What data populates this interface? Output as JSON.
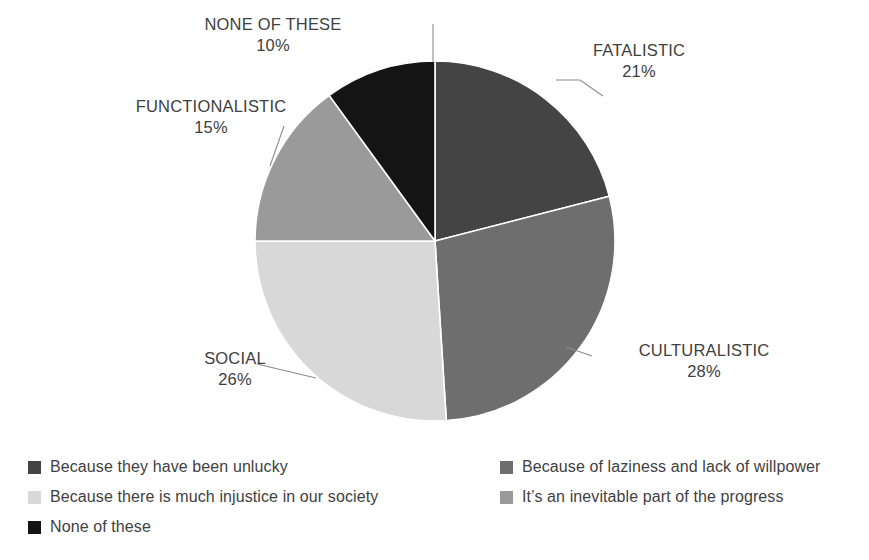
{
  "chart_data": {
    "type": "pie",
    "title": "",
    "categories": [
      "FATALISTIC",
      "CULTURALISTIC",
      "SOCIAL",
      "FUNCTIONALISTIC",
      "NONE OF THESE"
    ],
    "values": [
      21,
      28,
      26,
      15,
      10
    ],
    "unit": "%",
    "start_angle_deg": 0,
    "direction": "clockwise",
    "colors": [
      "#444444",
      "#6e6e6e",
      "#d8d8d8",
      "#9a9a9a",
      "#141414"
    ],
    "slice_separator_color": "#ffffff",
    "grid": false,
    "legend_position": "bottom",
    "slices": [
      {
        "category": "FATALISTIC",
        "value": 21,
        "label": "FATALISTIC",
        "percent_label": "21%",
        "color": "#444444"
      },
      {
        "category": "CULTURALISTIC",
        "value": 28,
        "label": "CULTURALISTIC",
        "percent_label": "28%",
        "color": "#6e6e6e"
      },
      {
        "category": "SOCIAL",
        "value": 26,
        "label": "SOCIAL",
        "percent_label": "26%",
        "color": "#d8d8d8"
      },
      {
        "category": "FUNCTIONALISTIC",
        "value": 15,
        "label": "FUNCTIONALISTIC",
        "percent_label": "15%",
        "color": "#9a9a9a"
      },
      {
        "category": "NONE OF THESE",
        "value": 10,
        "label": "NONE OF THESE",
        "percent_label": "10%",
        "color": "#141414"
      }
    ],
    "legend": [
      {
        "label": "Because they have been unlucky",
        "color": "#444444",
        "column": "left"
      },
      {
        "label": "Because there is much injustice in our society",
        "color": "#d8d8d8",
        "column": "left"
      },
      {
        "label": "None of these",
        "color": "#141414",
        "column": "left"
      },
      {
        "label": "Because of laziness and lack of willpower",
        "color": "#6e6e6e",
        "column": "right"
      },
      {
        "label": "It’s an inevitable part of the progress",
        "color": "#9a9a9a",
        "column": "right"
      }
    ]
  },
  "callouts": {
    "none": {
      "category": "NONE OF THESE",
      "percent": "10%"
    },
    "functional": {
      "category": "FUNCTIONALISTIC",
      "percent": "15%"
    },
    "fatalistic": {
      "category": "FATALISTIC",
      "percent": "21%"
    },
    "cultural": {
      "category": "CULTURALISTIC",
      "percent": "28%"
    },
    "social": {
      "category": "SOCIAL",
      "percent": "26%"
    }
  },
  "legend_left": [
    {
      "label": "Because they have been unlucky",
      "color": "#444444"
    },
    {
      "label": "Because there is much injustice in our society",
      "color": "#d8d8d8"
    },
    {
      "label": "None of these",
      "color": "#141414"
    }
  ],
  "legend_right": [
    {
      "label": "Because of laziness and lack of willpower",
      "color": "#6e6e6e"
    },
    {
      "label": "It’s an inevitable part of the progress",
      "color": "#9a9a9a"
    }
  ]
}
